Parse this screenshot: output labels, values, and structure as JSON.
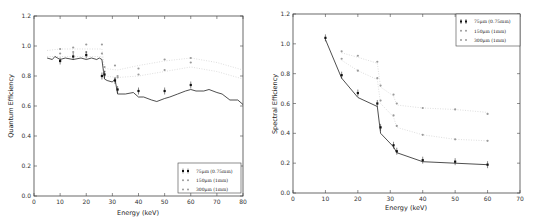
{
  "chart_data": [
    {
      "type": "scatter",
      "title": "",
      "xlabel": "Energy (keV)",
      "ylabel": "Quantum Efficiency",
      "xlim": [
        0,
        80
      ],
      "ylim": [
        0.0,
        1.2
      ],
      "xticks": [
        "0",
        "10",
        "20",
        "30",
        "40",
        "50",
        "60",
        "70",
        "80"
      ],
      "yticks": [
        "0.0",
        "0.2",
        "0.4",
        "0.6",
        "0.8",
        "1.0",
        "1.2"
      ],
      "grid": false,
      "legend_position": "lower right",
      "series": [
        {
          "name": "75μm (0.75mm)",
          "marker": "errorbar-black",
          "x": [
            10,
            15,
            20,
            26,
            27,
            31,
            32,
            40,
            50,
            60
          ],
          "y": [
            0.9,
            0.93,
            0.94,
            0.8,
            0.81,
            0.77,
            0.71,
            0.7,
            0.7,
            0.74
          ]
        },
        {
          "name": "150μm (1mm)",
          "marker": "gray-dot",
          "x": [
            10,
            15,
            20,
            26,
            27,
            31,
            32,
            40,
            50,
            60
          ],
          "y": [
            0.95,
            0.96,
            0.96,
            0.95,
            0.83,
            0.78,
            0.79,
            0.81,
            0.84,
            0.89
          ]
        },
        {
          "name": "300μm (1mm)",
          "marker": "gray-dot",
          "x": [
            10,
            15,
            20,
            26,
            27,
            31,
            32,
            40,
            50,
            60
          ],
          "y": [
            0.98,
            0.99,
            1.01,
            1.01,
            0.86,
            0.87,
            0.8,
            0.85,
            0.91,
            0.92
          ]
        },
        {
          "name": "model",
          "marker": "line-black",
          "x": [
            5,
            7,
            8,
            10,
            12,
            15,
            18,
            20,
            22,
            24,
            25,
            26,
            27,
            28,
            30,
            31,
            32,
            35,
            38,
            40,
            42,
            45,
            47,
            50,
            52,
            55,
            58,
            60,
            62,
            65,
            67,
            70,
            72,
            75,
            78,
            80
          ],
          "y": [
            0.92,
            0.91,
            0.93,
            0.91,
            0.92,
            0.91,
            0.92,
            0.91,
            0.92,
            0.91,
            0.92,
            0.91,
            0.78,
            0.77,
            0.76,
            0.78,
            0.68,
            0.68,
            0.69,
            0.66,
            0.66,
            0.64,
            0.63,
            0.65,
            0.66,
            0.68,
            0.7,
            0.71,
            0.7,
            0.7,
            0.71,
            0.69,
            0.68,
            0.64,
            0.64,
            0.61
          ]
        },
        {
          "name": "150μm trend",
          "marker": "dotted-gray",
          "x": [
            5,
            10,
            20,
            26,
            27,
            32,
            40,
            50,
            60,
            70,
            80
          ],
          "y": [
            0.93,
            0.93,
            0.93,
            0.93,
            0.8,
            0.79,
            0.8,
            0.83,
            0.86,
            0.83,
            0.78
          ]
        },
        {
          "name": "300μm trend",
          "marker": "dotted-gray",
          "x": [
            5,
            10,
            20,
            26,
            27,
            32,
            40,
            50,
            60,
            70,
            80
          ],
          "y": [
            0.97,
            0.98,
            0.98,
            0.98,
            0.85,
            0.84,
            0.87,
            0.9,
            0.92,
            0.89,
            0.84
          ]
        }
      ]
    },
    {
      "type": "scatter",
      "title": "",
      "xlabel": "Energy (keV)",
      "ylabel": "Spectral Efficiency",
      "xlim": [
        0,
        70
      ],
      "ylim": [
        0.0,
        1.2
      ],
      "xticks": [
        "0",
        "10",
        "20",
        "30",
        "40",
        "50",
        "60",
        "70"
      ],
      "yticks": [
        "0.0",
        "0.2",
        "0.4",
        "0.6",
        "0.8",
        "1.0",
        "1.2"
      ],
      "grid": false,
      "legend_position": "upper right",
      "series": [
        {
          "name": "75μm (0.75mm)",
          "marker": "errorbar-black",
          "x": [
            10,
            15,
            20,
            26,
            27,
            31,
            32,
            40,
            50,
            60
          ],
          "y": [
            1.04,
            0.79,
            0.67,
            0.6,
            0.44,
            0.32,
            0.28,
            0.22,
            0.21,
            0.19
          ]
        },
        {
          "name": "150μm (1mm)",
          "marker": "gray-dot",
          "x": [
            15,
            20,
            26,
            27,
            31,
            32,
            40,
            50,
            60
          ],
          "y": [
            0.9,
            0.82,
            0.77,
            0.62,
            0.52,
            0.45,
            0.39,
            0.36,
            0.35
          ]
        },
        {
          "name": "300μm (1mm)",
          "marker": "gray-dot",
          "x": [
            15,
            20,
            26,
            27,
            31,
            32,
            40,
            50,
            60
          ],
          "y": [
            0.95,
            0.92,
            0.88,
            0.72,
            0.66,
            0.6,
            0.57,
            0.56,
            0.53
          ]
        },
        {
          "name": "model",
          "marker": "line-black",
          "x": [
            10,
            15,
            20,
            26,
            27,
            31,
            32,
            40,
            50,
            60
          ],
          "y": [
            1.03,
            0.77,
            0.64,
            0.58,
            0.4,
            0.31,
            0.27,
            0.21,
            0.2,
            0.19
          ]
        },
        {
          "name": "150μm trend",
          "marker": "dotted-gray",
          "x": [
            15,
            20,
            26,
            27,
            31,
            32,
            40,
            50,
            60
          ],
          "y": [
            0.89,
            0.82,
            0.76,
            0.6,
            0.51,
            0.44,
            0.39,
            0.36,
            0.35
          ]
        },
        {
          "name": "300μm trend",
          "marker": "dotted-gray",
          "x": [
            15,
            20,
            26,
            27,
            31,
            32,
            40,
            50,
            60
          ],
          "y": [
            0.94,
            0.91,
            0.87,
            0.71,
            0.65,
            0.59,
            0.57,
            0.56,
            0.54
          ]
        }
      ]
    }
  ],
  "legend": {
    "items": [
      {
        "label": "75μm (0.75mm)"
      },
      {
        "label": "150μm (1mm)"
      },
      {
        "label": "300μm (1mm)"
      }
    ]
  },
  "colors": {
    "measured_75": "#111111",
    "series_gray": "#9a9a9a",
    "model_line": "#222222",
    "axes": "#444444"
  }
}
